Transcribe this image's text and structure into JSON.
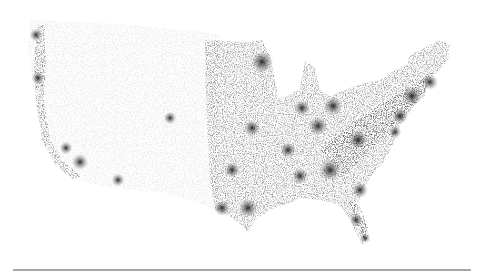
{
  "map": {
    "type": "dot-density",
    "subject": "United States population distribution",
    "colors": {
      "background": "#ffffff",
      "dots": "#1a1a1a",
      "rule": "#a8a8a8"
    },
    "hotspots": [
      {
        "x": 262,
        "y": 62,
        "r": 7
      },
      {
        "x": 333,
        "y": 106,
        "r": 6
      },
      {
        "x": 302,
        "y": 108,
        "r": 5
      },
      {
        "x": 318,
        "y": 126,
        "r": 6
      },
      {
        "x": 358,
        "y": 140,
        "r": 6
      },
      {
        "x": 288,
        "y": 150,
        "r": 5
      },
      {
        "x": 252,
        "y": 128,
        "r": 5
      },
      {
        "x": 232,
        "y": 170,
        "r": 5
      },
      {
        "x": 248,
        "y": 208,
        "r": 6
      },
      {
        "x": 222,
        "y": 208,
        "r": 5
      },
      {
        "x": 330,
        "y": 170,
        "r": 7
      },
      {
        "x": 300,
        "y": 176,
        "r": 5
      },
      {
        "x": 360,
        "y": 190,
        "r": 5
      },
      {
        "x": 412,
        "y": 96,
        "r": 6
      },
      {
        "x": 430,
        "y": 82,
        "r": 5
      },
      {
        "x": 400,
        "y": 116,
        "r": 5
      },
      {
        "x": 395,
        "y": 132,
        "r": 4
      },
      {
        "x": 170,
        "y": 118,
        "r": 4
      },
      {
        "x": 80,
        "y": 162,
        "r": 5
      },
      {
        "x": 66,
        "y": 148,
        "r": 4
      },
      {
        "x": 38,
        "y": 78,
        "r": 4
      },
      {
        "x": 36,
        "y": 35,
        "r": 4
      },
      {
        "x": 118,
        "y": 180,
        "r": 4
      },
      {
        "x": 356,
        "y": 220,
        "r": 4
      },
      {
        "x": 365,
        "y": 238,
        "r": 3
      }
    ]
  }
}
